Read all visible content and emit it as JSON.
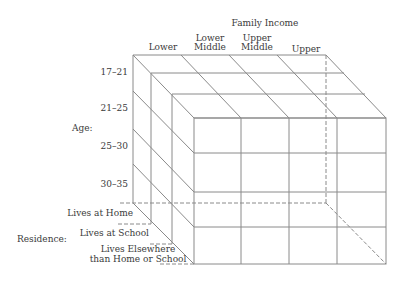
{
  "diagram": {
    "title": "Family Income",
    "income_levels": [
      {
        "line1": "",
        "line2": "Lower"
      },
      {
        "line1": "Lower",
        "line2": "Middle"
      },
      {
        "line1": "Upper",
        "line2": "Middle"
      },
      {
        "line1": "",
        "line2": "Upper"
      }
    ],
    "age_axis_label": "Age:",
    "age_groups": [
      "17–21",
      "21–25",
      "25–30",
      "30–35"
    ],
    "residence_axis_label": "Residence:",
    "residence_groups": [
      {
        "line1": "Lives at Home",
        "line2": ""
      },
      {
        "line1": "Lives at School",
        "line2": ""
      },
      {
        "line1": "Lives Elsewhere",
        "line2": "than Home or School"
      }
    ],
    "line_color": "#8a8a8a",
    "text_color": "#3a3a3a"
  }
}
